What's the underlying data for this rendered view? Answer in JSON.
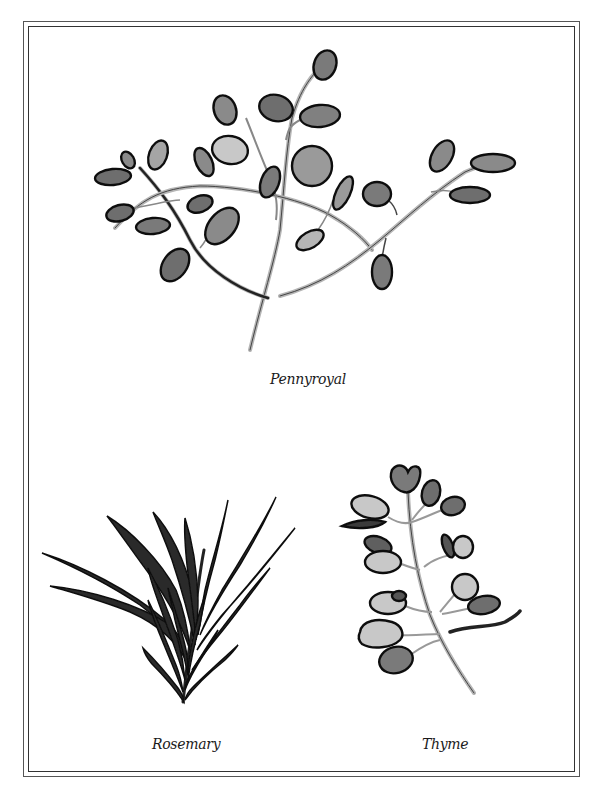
{
  "page": {
    "colors": {
      "border": "#333333",
      "ink": "#111111",
      "leaf_dark": "#6e6e6e",
      "leaf_mid": "#8c8c8c",
      "leaf_light": "#c8c8c8",
      "stem": "#b5b5b5",
      "rosemary": "#2a2a2a"
    }
  },
  "illustrations": [
    {
      "id": "pennyroyal",
      "label": "Pennyroyal",
      "icon": "pennyroyal-sprig-icon"
    },
    {
      "id": "rosemary",
      "label": "Rosemary",
      "icon": "rosemary-sprig-icon"
    },
    {
      "id": "thyme",
      "label": "Thyme",
      "icon": "thyme-sprig-icon"
    }
  ]
}
